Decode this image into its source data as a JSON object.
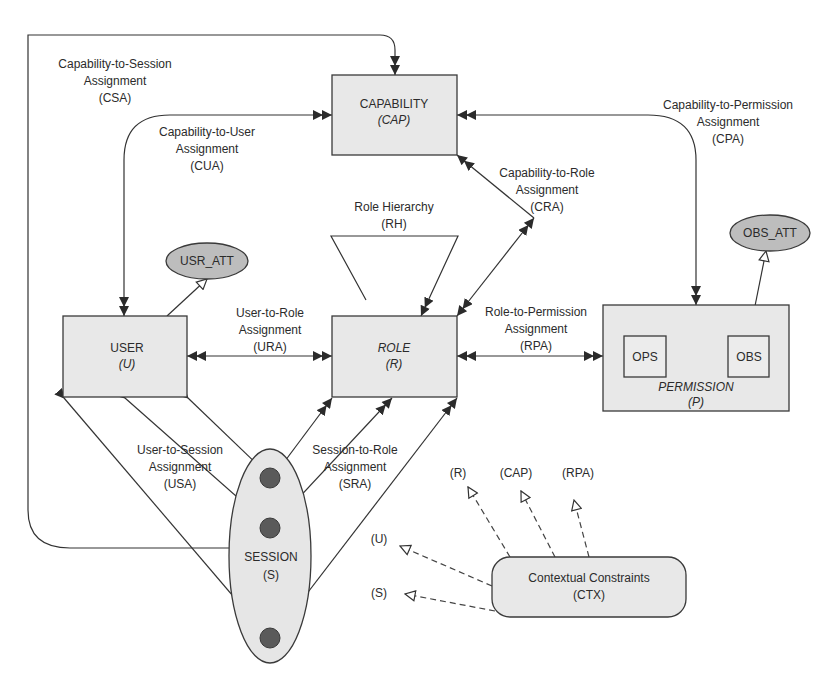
{
  "diagram": {
    "nodes": {
      "capability": {
        "title": "CAPABILITY",
        "abbr": "(CAP)"
      },
      "user": {
        "title": "USER",
        "abbr": "(U)"
      },
      "role": {
        "title": "ROLE",
        "abbr": "(R)"
      },
      "permission": {
        "title": "PERMISSION",
        "abbr": "(P)",
        "ops": "OPS",
        "obs": "OBS"
      },
      "session": {
        "title": "SESSION",
        "abbr": "(S)"
      },
      "usr_att": "USR_ATT",
      "obs_att": "OBS_ATT",
      "ctx": {
        "title": "Contextual Constraints",
        "abbr": "(CTX)"
      }
    },
    "relations": {
      "csa": {
        "line1": "Capability-to-Session",
        "line2": "Assignment",
        "abbr": "(CSA)"
      },
      "cua": {
        "line1": "Capability-to-User",
        "line2": "Assignment",
        "abbr": "(CUA)"
      },
      "cpa": {
        "line1": "Capability-to-Permission",
        "line2": "Assignment",
        "abbr": "(CPA)"
      },
      "cra": {
        "line1": "Capability-to-Role",
        "line2": "Assignment",
        "abbr": "(CRA)"
      },
      "rh": {
        "line1": "Role Hierarchy",
        "abbr": "(RH)"
      },
      "ura": {
        "line1": "User-to-Role",
        "line2": "Assignment",
        "abbr": "(URA)"
      },
      "rpa": {
        "line1": "Role-to-Permission",
        "line2": "Assignment",
        "abbr": "(RPA)"
      },
      "usa": {
        "line1": "User-to-Session",
        "line2": "Assignment",
        "abbr": "(USA)"
      },
      "sra": {
        "line1": "Session-to-Role",
        "line2": "Assignment",
        "abbr": "(SRA)"
      }
    },
    "ctx_targets": [
      "(R)",
      "(CAP)",
      "(RPA)",
      "(U)",
      "(S)"
    ]
  }
}
